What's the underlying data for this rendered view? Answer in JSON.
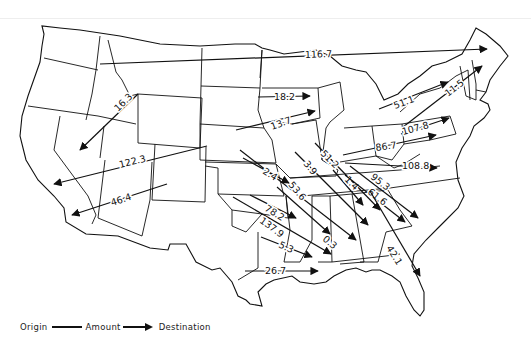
{
  "map": {
    "subject": "Interstate flows (United States map)",
    "flows": [
      {
        "label": "116.7",
        "x1": 100,
        "y1": 64,
        "x2": 487,
        "y2": 49,
        "lx": 305,
        "ly": 58,
        "rot": -2
      },
      {
        "label": "16.3",
        "x1": 138,
        "y1": 94,
        "x2": 80,
        "y2": 150,
        "lx": 118,
        "ly": 112,
        "rot": -44
      },
      {
        "label": "122.3",
        "x1": 207,
        "y1": 146,
        "x2": 54,
        "y2": 184,
        "lx": 120,
        "ly": 168,
        "rot": -14
      },
      {
        "label": "46.4",
        "x1": 167,
        "y1": 184,
        "x2": 72,
        "y2": 215,
        "lx": 112,
        "ly": 206,
        "rot": -18
      },
      {
        "label": "18.2",
        "x1": 258,
        "y1": 97,
        "x2": 310,
        "y2": 96,
        "lx": 274,
        "ly": 100,
        "rot": 0
      },
      {
        "label": "13.7",
        "x1": 236,
        "y1": 130,
        "x2": 315,
        "y2": 111,
        "lx": 272,
        "ly": 130,
        "rot": -20
      },
      {
        "label": "51.1",
        "x1": 379,
        "y1": 109,
        "x2": 448,
        "y2": 82,
        "lx": 395,
        "ly": 109,
        "rot": -20
      },
      {
        "label": "11.5",
        "x1": 403,
        "y1": 127,
        "x2": 482,
        "y2": 66,
        "lx": 448,
        "ly": 97,
        "rot": -38
      },
      {
        "label": "107.8",
        "x1": 401,
        "y1": 134,
        "x2": 449,
        "y2": 118,
        "lx": 403,
        "ly": 135,
        "rot": -15
      },
      {
        "label": "86.7",
        "x1": 343,
        "y1": 155,
        "x2": 436,
        "y2": 135,
        "lx": 376,
        "ly": 151,
        "rot": -8
      },
      {
        "label": "108.8",
        "x1": 345,
        "y1": 163,
        "x2": 437,
        "y2": 168,
        "lx": 402,
        "ly": 169,
        "rot": 0
      },
      {
        "label": "51.2",
        "x1": 315,
        "y1": 143,
        "x2": 380,
        "y2": 210,
        "lx": 320,
        "ly": 154,
        "rot": 45
      },
      {
        "label": "3.9",
        "x1": 295,
        "y1": 152,
        "x2": 368,
        "y2": 225,
        "lx": 303,
        "ly": 164,
        "rot": 50
      },
      {
        "label": "1.4",
        "x1": 333,
        "y1": 170,
        "x2": 363,
        "y2": 205,
        "lx": 344,
        "ly": 180,
        "rot": 45
      },
      {
        "label": "95.3",
        "x1": 350,
        "y1": 166,
        "x2": 418,
        "y2": 218,
        "lx": 370,
        "ly": 178,
        "rot": 38
      },
      {
        "label": "61.6",
        "x1": 345,
        "y1": 175,
        "x2": 405,
        "y2": 222,
        "lx": 367,
        "ly": 193,
        "rot": 38
      },
      {
        "label": "53.6",
        "x1": 240,
        "y1": 150,
        "x2": 356,
        "y2": 240,
        "lx": 288,
        "ly": 185,
        "rot": 50
      },
      {
        "label": "2.4",
        "x1": 243,
        "y1": 158,
        "x2": 289,
        "y2": 183,
        "lx": 262,
        "ly": 173,
        "rot": 32
      },
      {
        "label": "78.2",
        "x1": 250,
        "y1": 195,
        "x2": 296,
        "y2": 218,
        "lx": 264,
        "ly": 210,
        "rot": 32
      },
      {
        "label": "137.9",
        "x1": 233,
        "y1": 197,
        "x2": 331,
        "y2": 254,
        "lx": 259,
        "ly": 222,
        "rot": 36
      },
      {
        "label": "0.3",
        "x1": 277,
        "y1": 187,
        "x2": 330,
        "y2": 234,
        "lx": 322,
        "ly": 240,
        "rot": 40
      },
      {
        "label": "5.3",
        "x1": 261,
        "y1": 237,
        "x2": 312,
        "y2": 257,
        "lx": 278,
        "ly": 247,
        "rot": 25
      },
      {
        "label": "42.1",
        "x1": 370,
        "y1": 191,
        "x2": 420,
        "y2": 276,
        "lx": 386,
        "ly": 248,
        "rot": 58
      },
      {
        "label": "26.7",
        "x1": 245,
        "y1": 271,
        "x2": 318,
        "y2": 271,
        "lx": 265,
        "ly": 274,
        "rot": 0
      }
    ]
  },
  "legend": {
    "origin": "Origin",
    "amount": "Amount",
    "destination": "Destination"
  }
}
